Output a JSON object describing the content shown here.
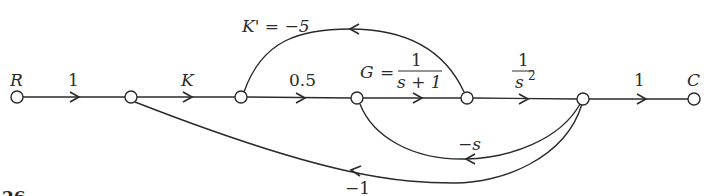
{
  "diagram": {
    "type": "signal-flow-graph",
    "nodes": [
      {
        "id": "R",
        "label": "R"
      },
      {
        "id": "n1",
        "label": ""
      },
      {
        "id": "n2",
        "label": ""
      },
      {
        "id": "n3",
        "label": ""
      },
      {
        "id": "n4",
        "label": ""
      },
      {
        "id": "n5",
        "label": ""
      },
      {
        "id": "C",
        "label": "C"
      }
    ],
    "edges": [
      {
        "from": "R",
        "to": "n1",
        "gain": "1"
      },
      {
        "from": "n1",
        "to": "n2",
        "gain": "K"
      },
      {
        "from": "n2",
        "to": "n3",
        "gain": "0.5"
      },
      {
        "from": "n3",
        "to": "n4",
        "gain": "G = 1/(s + 1)",
        "gain_name": "G",
        "gain_num": "1",
        "gain_den": "s + 1"
      },
      {
        "from": "n4",
        "to": "n5",
        "gain": "1/s²",
        "gain_num": "1",
        "gain_den": "s"
      },
      {
        "from": "n5",
        "to": "C",
        "gain": "1"
      },
      {
        "from": "n4",
        "to": "n2",
        "gain": "K' = −5"
      },
      {
        "from": "n5",
        "to": "n3",
        "gain": "−s"
      },
      {
        "from": "n5",
        "to": "n1",
        "gain": "−1"
      }
    ],
    "figure_number_fragment": "26"
  }
}
